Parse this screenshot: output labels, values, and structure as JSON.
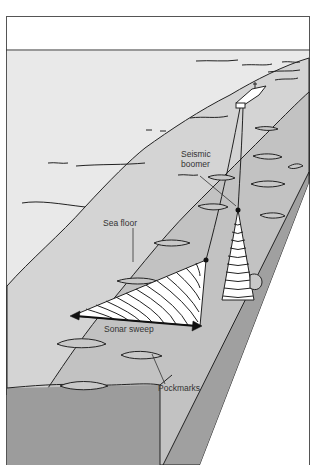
{
  "diagram": {
    "labels": {
      "seismic_boomer_line1": "Seismic",
      "seismic_boomer_line2": "boomer",
      "sea_floor": "Sea floor",
      "sonar_sweep": "Sonar sweep",
      "pockmarks": "Pockmarks"
    },
    "colors": {
      "sea_surface": "#e8e8e8",
      "sea_floor_light": "#d6d6d6",
      "sea_floor_mid": "#c4c4c4",
      "sea_floor_dark": "#a8a8a8",
      "cross_section": "#9a9a9a",
      "outline": "#222222"
    }
  }
}
